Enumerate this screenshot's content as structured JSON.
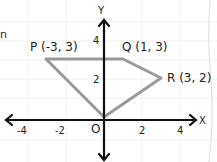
{
  "diagram": {
    "axes": {
      "x_label": "X",
      "y_label": "Y",
      "origin_label": "O"
    },
    "x_ticks": [
      {
        "value": -4,
        "label": "-4"
      },
      {
        "value": -2,
        "label": "-2"
      },
      {
        "value": 2,
        "label": "2"
      },
      {
        "value": 4,
        "label": "4"
      }
    ],
    "y_ticks": [
      {
        "value": 2,
        "label": "2"
      },
      {
        "value": 4,
        "label": "4"
      }
    ],
    "points": [
      {
        "name": "P",
        "label": "P (-3, 3)",
        "x": -3,
        "y": 3
      },
      {
        "name": "Q",
        "label": "Q (1, 3)",
        "x": 1,
        "y": 3
      },
      {
        "name": "R",
        "label": "R (3, 2)",
        "x": 3,
        "y": 2
      },
      {
        "name": "O",
        "label": "O",
        "x": 0,
        "y": 0
      }
    ],
    "polygon": [
      "P",
      "Q",
      "R",
      "O"
    ],
    "colors": {
      "axis": "#111111",
      "polygon": "#9a9a9a",
      "grid": "#eeeeee"
    },
    "stray_mark": "n"
  }
}
